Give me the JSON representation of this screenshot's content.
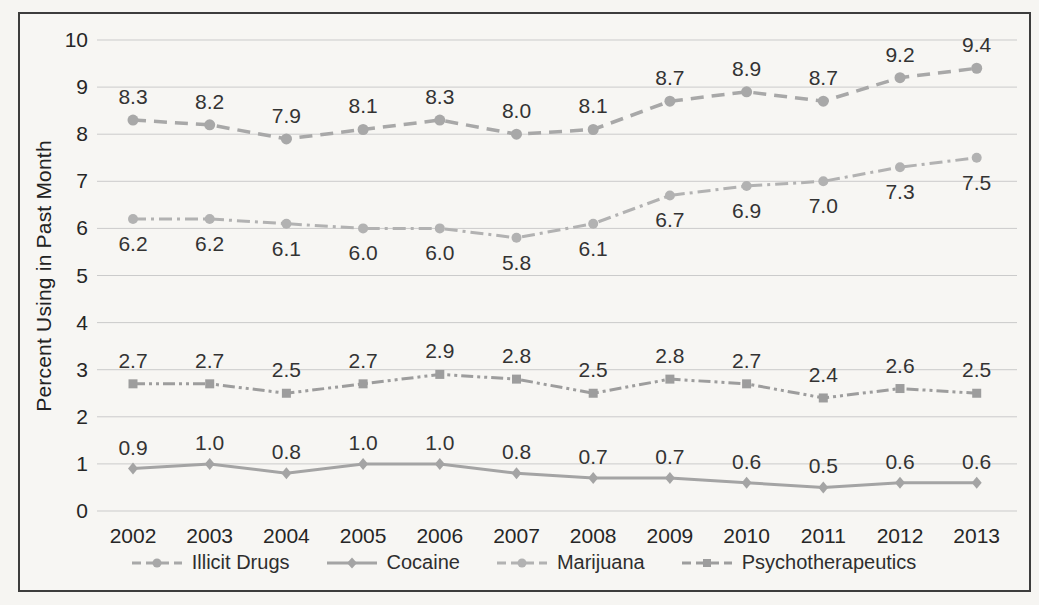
{
  "chart_data": {
    "type": "line",
    "title": "",
    "xlabel": "",
    "ylabel": "Percent Using in Past Month",
    "ylim": [
      0,
      10
    ],
    "yticks": [
      0,
      1,
      2,
      3,
      4,
      5,
      6,
      7,
      8,
      9,
      10
    ],
    "grid": "horizontal",
    "legend_position": "bottom",
    "categories": [
      "2002",
      "2003",
      "2004",
      "2005",
      "2006",
      "2007",
      "2008",
      "2009",
      "2010",
      "2011",
      "2012",
      "2013"
    ],
    "series": [
      {
        "name": "Illicit Drugs",
        "values": [
          8.3,
          8.2,
          7.9,
          8.1,
          8.3,
          8.0,
          8.1,
          8.7,
          8.9,
          8.7,
          9.2,
          9.4
        ],
        "color": "#a8a8a8",
        "line_style": "dash",
        "marker": "circle",
        "label_position": "above"
      },
      {
        "name": "Marijuana",
        "values": [
          6.2,
          6.2,
          6.1,
          6.0,
          6.0,
          5.8,
          6.1,
          6.7,
          6.9,
          7.0,
          7.3,
          7.5
        ],
        "color": "#b2b2b2",
        "line_style": "dash-dot",
        "marker": "circle",
        "label_position": "below"
      },
      {
        "name": "Psychotherapeutics",
        "values": [
          2.7,
          2.7,
          2.5,
          2.7,
          2.9,
          2.8,
          2.5,
          2.8,
          2.7,
          2.4,
          2.6,
          2.5
        ],
        "color": "#9d9d9d",
        "line_style": "dash-dot-dot",
        "marker": "square",
        "label_position": "above"
      },
      {
        "name": "Cocaine",
        "values": [
          0.9,
          1.0,
          0.8,
          1.0,
          1.0,
          0.8,
          0.7,
          0.7,
          0.6,
          0.5,
          0.6,
          0.6
        ],
        "color": "#a4a4a4",
        "line_style": "solid",
        "marker": "diamond",
        "label_position": "above"
      }
    ],
    "legend_order": [
      0,
      3,
      1,
      2
    ]
  },
  "colors": {
    "paper": "#f6f5f2",
    "frame": "#3d3d3d",
    "gridline": "#cbcbcb",
    "tick_label": "#262626",
    "data_label": "#333333"
  }
}
